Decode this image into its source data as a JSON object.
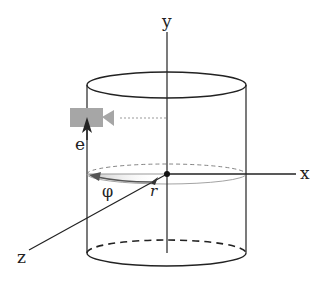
{
  "diagram": {
    "type": "cylindrical-coordinate-system",
    "labels": {
      "y_axis": "y",
      "x_axis": "x",
      "z_axis": "z",
      "e_vector": "e",
      "phi_angle": "φ",
      "radius": "r"
    },
    "colors": {
      "line": "#222222",
      "camera": "#a6a6a6",
      "thin_gray": "#888888",
      "arrow_dark": "#222222"
    },
    "elements": [
      "cylinder",
      "y-axis",
      "x-axis",
      "z-axis",
      "origin-point",
      "camera-icon",
      "e-arrow",
      "phi-arc",
      "radius-arrow"
    ]
  }
}
